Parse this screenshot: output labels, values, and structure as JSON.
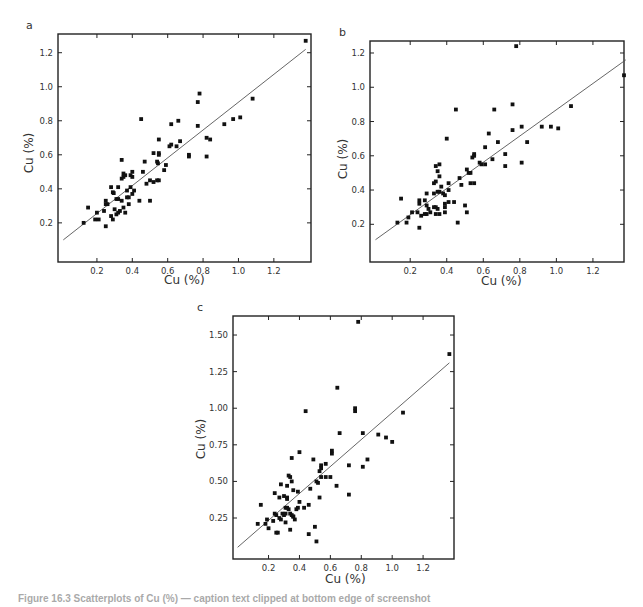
{
  "figure": {
    "caption": "Figure 16.3  Scatterplots of Cu (%) — caption text clipped at bottom edge of screenshot"
  },
  "chart_data": [
    {
      "panel": "a",
      "type": "scatter",
      "title": "",
      "xlabel": "Cu (%)",
      "ylabel": "Cu (%)",
      "xlim": [
        -0.02,
        1.41
      ],
      "ylim": [
        -0.03,
        1.31
      ],
      "xticks": [
        0.2,
        0.4,
        0.6,
        0.8,
        1.0,
        1.2
      ],
      "xtick_labels": [
        "0.2",
        "0.4",
        "0.6",
        "0.8",
        "1.0",
        "1.2"
      ],
      "yticks": [
        0.2,
        0.4,
        0.6,
        0.8,
        1.0,
        1.2
      ],
      "ytick_labels": [
        "0.2",
        "0.4",
        "0.6",
        "0.8",
        "1.0",
        "1.2"
      ],
      "grid": false,
      "legend": null,
      "fit_line": {
        "x0": 0.01,
        "y0": 0.1,
        "x1": 1.38,
        "y1": 1.22
      },
      "points": [
        [
          0.125,
          0.2
        ],
        [
          0.15,
          0.29
        ],
        [
          0.19,
          0.22
        ],
        [
          0.21,
          0.22
        ],
        [
          0.2,
          0.26
        ],
        [
          0.24,
          0.27
        ],
        [
          0.25,
          0.33
        ],
        [
          0.25,
          0.31
        ],
        [
          0.26,
          0.31
        ],
        [
          0.25,
          0.18
        ],
        [
          0.28,
          0.41
        ],
        [
          0.29,
          0.38
        ],
        [
          0.295,
          0.375
        ],
        [
          0.28,
          0.24
        ],
        [
          0.29,
          0.22
        ],
        [
          0.3,
          0.28
        ],
        [
          0.31,
          0.25
        ],
        [
          0.32,
          0.26
        ],
        [
          0.33,
          0.27
        ],
        [
          0.31,
          0.34
        ],
        [
          0.32,
          0.34
        ],
        [
          0.34,
          0.33
        ],
        [
          0.32,
          0.41
        ],
        [
          0.34,
          0.57
        ],
        [
          0.34,
          0.46
        ],
        [
          0.35,
          0.47
        ],
        [
          0.35,
          0.49
        ],
        [
          0.36,
          0.48
        ],
        [
          0.35,
          0.29
        ],
        [
          0.36,
          0.26
        ],
        [
          0.37,
          0.39
        ],
        [
          0.37,
          0.35
        ],
        [
          0.38,
          0.35
        ],
        [
          0.38,
          0.31
        ],
        [
          0.39,
          0.41
        ],
        [
          0.39,
          0.48
        ],
        [
          0.4,
          0.5
        ],
        [
          0.4,
          0.47
        ],
        [
          0.4,
          0.37
        ],
        [
          0.41,
          0.39
        ],
        [
          0.44,
          0.33
        ],
        [
          0.45,
          0.81
        ],
        [
          0.46,
          0.5
        ],
        [
          0.47,
          0.56
        ],
        [
          0.48,
          0.43
        ],
        [
          0.5,
          0.45
        ],
        [
          0.5,
          0.33
        ],
        [
          0.52,
          0.61
        ],
        [
          0.52,
          0.44
        ],
        [
          0.54,
          0.45
        ],
        [
          0.54,
          0.56
        ],
        [
          0.545,
          0.55
        ],
        [
          0.55,
          0.69
        ],
        [
          0.55,
          0.61
        ],
        [
          0.55,
          0.6
        ],
        [
          0.55,
          0.45
        ],
        [
          0.58,
          0.51
        ],
        [
          0.59,
          0.54
        ],
        [
          0.61,
          0.65
        ],
        [
          0.62,
          0.66
        ],
        [
          0.62,
          0.78
        ],
        [
          0.65,
          0.65
        ],
        [
          0.66,
          0.8
        ],
        [
          0.67,
          0.68
        ],
        [
          0.72,
          0.6
        ],
        [
          0.72,
          0.59
        ],
        [
          0.77,
          0.77
        ],
        [
          0.77,
          0.91
        ],
        [
          0.78,
          0.96
        ],
        [
          0.82,
          0.7
        ],
        [
          0.82,
          0.59
        ],
        [
          0.84,
          0.69
        ],
        [
          0.92,
          0.78
        ],
        [
          0.97,
          0.81
        ],
        [
          1.01,
          0.82
        ],
        [
          1.08,
          0.93
        ],
        [
          1.38,
          1.27
        ]
      ]
    },
    {
      "panel": "b",
      "type": "scatter",
      "title": "",
      "xlabel": "Cu (%)",
      "ylabel": "Cu (%)",
      "xlim": [
        -0.02,
        1.37
      ],
      "ylim": [
        -0.02,
        1.27
      ],
      "xticks": [
        0.2,
        0.4,
        0.6,
        0.8,
        1.0,
        1.2
      ],
      "xtick_labels": [
        "0.2",
        "0.4",
        "0.6",
        "0.8",
        "1.0",
        "1.2"
      ],
      "yticks": [
        0.2,
        0.4,
        0.6,
        0.8,
        1.0,
        1.2
      ],
      "ytick_labels": [
        "0.2",
        "0.4",
        "0.6",
        "0.8",
        "1.0",
        "1.2"
      ],
      "grid": false,
      "legend": null,
      "fit_line": {
        "x0": 0.01,
        "y0": 0.11,
        "x1": 1.38,
        "y1": 1.16
      },
      "points": [
        [
          0.13,
          0.21
        ],
        [
          0.15,
          0.35
        ],
        [
          0.18,
          0.21
        ],
        [
          0.19,
          0.24
        ],
        [
          0.21,
          0.27
        ],
        [
          0.24,
          0.27
        ],
        [
          0.25,
          0.34
        ],
        [
          0.25,
          0.32
        ],
        [
          0.25,
          0.18
        ],
        [
          0.26,
          0.25
        ],
        [
          0.28,
          0.34
        ],
        [
          0.29,
          0.31
        ],
        [
          0.29,
          0.38
        ],
        [
          0.28,
          0.26
        ],
        [
          0.29,
          0.26
        ],
        [
          0.3,
          0.29
        ],
        [
          0.31,
          0.27
        ],
        [
          0.33,
          0.38
        ],
        [
          0.33,
          0.44
        ],
        [
          0.33,
          0.3
        ],
        [
          0.34,
          0.3
        ],
        [
          0.35,
          0.29
        ],
        [
          0.34,
          0.26
        ],
        [
          0.34,
          0.45
        ],
        [
          0.34,
          0.54
        ],
        [
          0.35,
          0.51
        ],
        [
          0.36,
          0.55
        ],
        [
          0.36,
          0.48
        ],
        [
          0.35,
          0.39
        ],
        [
          0.36,
          0.39
        ],
        [
          0.36,
          0.26
        ],
        [
          0.37,
          0.42
        ],
        [
          0.38,
          0.38
        ],
        [
          0.39,
          0.37
        ],
        [
          0.39,
          0.3
        ],
        [
          0.39,
          0.32
        ],
        [
          0.39,
          0.27
        ],
        [
          0.4,
          0.7
        ],
        [
          0.41,
          0.33
        ],
        [
          0.41,
          0.44
        ],
        [
          0.41,
          0.4
        ],
        [
          0.44,
          0.33
        ],
        [
          0.45,
          0.87
        ],
        [
          0.46,
          0.21
        ],
        [
          0.47,
          0.47
        ],
        [
          0.48,
          0.43
        ],
        [
          0.5,
          0.31
        ],
        [
          0.51,
          0.52
        ],
        [
          0.51,
          0.27
        ],
        [
          0.52,
          0.5
        ],
        [
          0.53,
          0.5
        ],
        [
          0.53,
          0.44
        ],
        [
          0.54,
          0.59
        ],
        [
          0.55,
          0.61
        ],
        [
          0.55,
          0.6
        ],
        [
          0.55,
          0.44
        ],
        [
          0.58,
          0.56
        ],
        [
          0.59,
          0.55
        ],
        [
          0.61,
          0.65
        ],
        [
          0.61,
          0.55
        ],
        [
          0.63,
          0.73
        ],
        [
          0.65,
          0.58
        ],
        [
          0.66,
          0.87
        ],
        [
          0.68,
          0.68
        ],
        [
          0.72,
          0.61
        ],
        [
          0.72,
          0.54
        ],
        [
          0.76,
          0.9
        ],
        [
          0.76,
          0.75
        ],
        [
          0.78,
          1.24
        ],
        [
          0.81,
          0.77
        ],
        [
          0.81,
          0.56
        ],
        [
          0.84,
          0.68
        ],
        [
          0.92,
          0.77
        ],
        [
          0.97,
          0.77
        ],
        [
          1.01,
          0.76
        ],
        [
          1.08,
          0.89
        ],
        [
          1.37,
          1.07
        ]
      ]
    },
    {
      "panel": "c",
      "type": "scatter",
      "title": "",
      "xlabel": "Cu (%)",
      "ylabel": "Cu (%)",
      "xlim": [
        -0.03,
        1.4
      ],
      "ylim": [
        -0.03,
        1.63
      ],
      "xticks": [
        0.2,
        0.4,
        0.6,
        0.8,
        1.0,
        1.2
      ],
      "xtick_labels": [
        "0.2",
        "0.4",
        "0.6",
        "0.8",
        "1.0",
        "1.2"
      ],
      "yticks": [
        0.25,
        0.5,
        0.75,
        1.0,
        1.25,
        1.5
      ],
      "ytick_labels": [
        "0.25",
        "0.50",
        "0.75",
        "1.00",
        "1.25",
        "1.50"
      ],
      "grid": false,
      "legend": null,
      "fit_line": {
        "x0": 0.0,
        "y0": 0.05,
        "x1": 1.37,
        "y1": 1.31
      },
      "points": [
        [
          0.13,
          0.21
        ],
        [
          0.15,
          0.34
        ],
        [
          0.18,
          0.21
        ],
        [
          0.19,
          0.24
        ],
        [
          0.2,
          0.18
        ],
        [
          0.23,
          0.23
        ],
        [
          0.24,
          0.28
        ],
        [
          0.25,
          0.27
        ],
        [
          0.24,
          0.42
        ],
        [
          0.25,
          0.15
        ],
        [
          0.26,
          0.15
        ],
        [
          0.27,
          0.39
        ],
        [
          0.27,
          0.25
        ],
        [
          0.28,
          0.24
        ],
        [
          0.28,
          0.48
        ],
        [
          0.29,
          0.28
        ],
        [
          0.3,
          0.27
        ],
        [
          0.31,
          0.28
        ],
        [
          0.3,
          0.4
        ],
        [
          0.31,
          0.32
        ],
        [
          0.32,
          0.32
        ],
        [
          0.33,
          0.31
        ],
        [
          0.31,
          0.22
        ],
        [
          0.32,
          0.47
        ],
        [
          0.32,
          0.39
        ],
        [
          0.32,
          0.38
        ],
        [
          0.33,
          0.54
        ],
        [
          0.34,
          0.53
        ],
        [
          0.35,
          0.5
        ],
        [
          0.34,
          0.28
        ],
        [
          0.35,
          0.27
        ],
        [
          0.36,
          0.26
        ],
        [
          0.36,
          0.26
        ],
        [
          0.37,
          0.24
        ],
        [
          0.34,
          0.17
        ],
        [
          0.35,
          0.66
        ],
        [
          0.36,
          0.44
        ],
        [
          0.38,
          0.31
        ],
        [
          0.39,
          0.32
        ],
        [
          0.39,
          0.43
        ],
        [
          0.4,
          0.36
        ],
        [
          0.4,
          0.7
        ],
        [
          0.43,
          0.32
        ],
        [
          0.44,
          0.98
        ],
        [
          0.46,
          0.34
        ],
        [
          0.46,
          0.14
        ],
        [
          0.47,
          0.45
        ],
        [
          0.49,
          0.65
        ],
        [
          0.5,
          0.19
        ],
        [
          0.51,
          0.09
        ],
        [
          0.51,
          0.5
        ],
        [
          0.52,
          0.49
        ],
        [
          0.53,
          0.57
        ],
        [
          0.53,
          0.39
        ],
        [
          0.54,
          0.61
        ],
        [
          0.54,
          0.59
        ],
        [
          0.54,
          0.53
        ],
        [
          0.57,
          0.62
        ],
        [
          0.57,
          0.53
        ],
        [
          0.6,
          0.53
        ],
        [
          0.61,
          0.71
        ],
        [
          0.61,
          0.69
        ],
        [
          0.64,
          0.47
        ],
        [
          0.645,
          1.14
        ],
        [
          0.66,
          0.83
        ],
        [
          0.72,
          0.61
        ],
        [
          0.72,
          0.41
        ],
        [
          0.76,
          1.0
        ],
        [
          0.76,
          0.98
        ],
        [
          0.78,
          1.59
        ],
        [
          0.81,
          0.83
        ],
        [
          0.81,
          0.6
        ],
        [
          0.84,
          0.65
        ],
        [
          0.91,
          0.82
        ],
        [
          0.96,
          0.8
        ],
        [
          1.0,
          0.77
        ],
        [
          1.07,
          0.97
        ],
        [
          1.37,
          1.37
        ]
      ]
    }
  ],
  "panels": {
    "a": {
      "letter": "a",
      "xlabel": "Cu (%)",
      "ylabel": "Cu (%)"
    },
    "b": {
      "letter": "b",
      "xlabel": "Cu (%)",
      "ylabel": "Cu (%)"
    },
    "c": {
      "letter": "c",
      "xlabel": "Cu (%)",
      "ylabel": "Cu (%)"
    }
  },
  "colors": {
    "marker": "#111111",
    "axis": "#222222",
    "fit_line": "#555555",
    "text": "#333333"
  }
}
